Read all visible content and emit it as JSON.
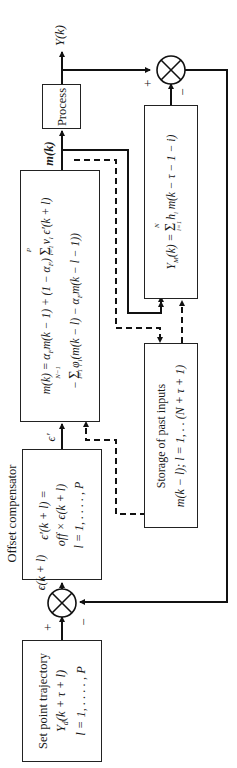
{
  "diagram": {
    "type": "block-diagram",
    "orientation": "rotated-90-ccw",
    "blocks": {
      "setpoint": {
        "title": "Set point trajectory",
        "line1": "Y_d(k + τ + l)",
        "line2": "l = 1, . . . . , P"
      },
      "offset": {
        "caption": "Offset compensator",
        "line1": "ϵ′(k + l) =",
        "line2": "off × ϵ(k + l)",
        "line3": "l = 1, . . . . , P"
      },
      "controller": {
        "line1": "m(k) = α_F m(k − 1) + (1 − α_F) Σ_{l=1}^{P} ν_l ϵ′(k + l)",
        "line2": "− Σ_{l=1}^{N−1} φ_l(m(k − l) − α_F m(k − l − 1))"
      },
      "process": {
        "title": "Process"
      },
      "model": {
        "line1": "Y_M(k) = Σ_{i=1}^{N} h_i m(k − τ − 1 − i)"
      },
      "storage": {
        "title": "Storage of past inputs",
        "line1": "m(k − l); l = 1, . . (N + τ + 1)"
      }
    },
    "signals": {
      "output": "Y(k)",
      "manipulated": "m(k)",
      "error": "ϵ(k + l)",
      "corrected_error": "ϵ′",
      "plus": "+",
      "minus": "−"
    },
    "text": {
      "sp_title": "Set point trajectory",
      "sp_y": "Y",
      "sp_sub": "d",
      "sp_arg": "(k + τ + l)",
      "sp_range": "l = 1, . . . . , P",
      "off_caption": "Offset compensator",
      "off_l1": "ϵ′(k + l) =",
      "off_l2": "off × ϵ(k + l)",
      "off_l3": "l = 1, . . . . , P",
      "ctl_l1a": "m(k) = α",
      "ctl_l1b": "m(k − 1) + (1 − α",
      "ctl_l1c": ")",
      "ctl_sum": "Σ",
      "ctl_sum1_top": "P",
      "ctl_sum1_bot": "l=1",
      "ctl_l1d": "ν",
      "ctl_l1e": " ϵ′(k + l)",
      "ctl_l2a": "−",
      "ctl_sum2_top": "N−1",
      "ctl_sum2_bot": "l=1",
      "ctl_l2b": "φ",
      "ctl_l2c": "(m(k − l) − α",
      "ctl_l2d": "m(k − l − 1))",
      "sub_F": "F",
      "sub_l": "l",
      "proc": "Process",
      "mdl_a": "Y",
      "mdl_sub": "M",
      "mdl_b": "(k) =",
      "mdl_top": "N",
      "mdl_bot": "i=1",
      "mdl_c": "h",
      "mdl_sub_i": "i",
      "mdl_d": " m(k − τ − 1 − i)",
      "st_title": "Storage of past inputs",
      "st_l1": "m(k − l); l = 1, . . (N + τ + 1)",
      "sig_y": "Y(k)",
      "sig_m": "m(k)",
      "sig_e": "ϵ(k + l)",
      "sig_ep": "ϵ′",
      "plus": "+",
      "minus": "−"
    }
  }
}
